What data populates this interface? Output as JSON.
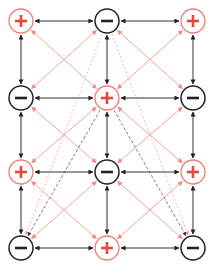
{
  "colors": {
    "positive": "#e8453c",
    "positive_ring": "#ee7d74",
    "negative": "#222222",
    "black_edge": "#333333",
    "pink_edge": "#f4a39c",
    "dark_dashed": "#556070",
    "pink_dashed": "#f0a8a2"
  },
  "grid": {
    "columns_x": [
      21,
      107,
      193
    ],
    "rows_y": [
      21,
      98,
      172,
      248
    ],
    "node_radius": 12
  },
  "nodes": [
    {
      "id": "r0c0",
      "row": 0,
      "col": 0,
      "sign": "+"
    },
    {
      "id": "r0c1",
      "row": 0,
      "col": 1,
      "sign": "-"
    },
    {
      "id": "r0c2",
      "row": 0,
      "col": 2,
      "sign": "+"
    },
    {
      "id": "r1c0",
      "row": 1,
      "col": 0,
      "sign": "-"
    },
    {
      "id": "r1c1",
      "row": 1,
      "col": 1,
      "sign": "+"
    },
    {
      "id": "r1c2",
      "row": 1,
      "col": 2,
      "sign": "-"
    },
    {
      "id": "r2c0",
      "row": 2,
      "col": 0,
      "sign": "+"
    },
    {
      "id": "r2c1",
      "row": 2,
      "col": 1,
      "sign": "-"
    },
    {
      "id": "r2c2",
      "row": 2,
      "col": 2,
      "sign": "+"
    },
    {
      "id": "r3c0",
      "row": 3,
      "col": 0,
      "sign": "-"
    },
    {
      "id": "r3c1",
      "row": 3,
      "col": 1,
      "sign": "+"
    },
    {
      "id": "r3c2",
      "row": 3,
      "col": 2,
      "sign": "-"
    }
  ],
  "edges": {
    "orthogonal_bidirectional": "black solid arrows between horizontal and vertical neighbors",
    "diagonal_bidirectional": "pink solid arrows between diagonal neighbors",
    "dashed": [
      {
        "from": "r0c1",
        "to": "r3c0",
        "style": "pink-dashed"
      },
      {
        "from": "r0c1",
        "to": "r3c2",
        "style": "pink-dashed"
      },
      {
        "from": "r1c1",
        "to": "r3c0",
        "style": "dark-dashed"
      },
      {
        "from": "r1c1",
        "to": "r3c2",
        "style": "dark-dashed"
      }
    ]
  }
}
